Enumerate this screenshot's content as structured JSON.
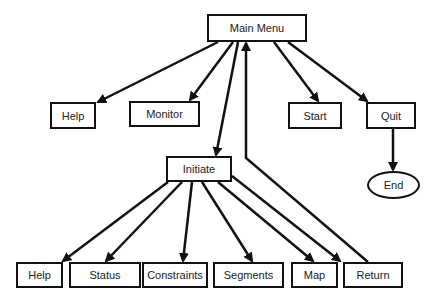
{
  "diagram": {
    "type": "menu-hierarchy",
    "nodes": [
      {
        "id": "main_menu",
        "label": "Main Menu",
        "shape": "rect",
        "x": 207,
        "y": 14,
        "w": 100,
        "h": 28
      },
      {
        "id": "help_top",
        "label": "Help",
        "shape": "rect",
        "x": 50,
        "y": 102,
        "w": 46,
        "h": 27
      },
      {
        "id": "monitor",
        "label": "Monitor",
        "shape": "rect",
        "x": 129,
        "y": 101,
        "w": 71,
        "h": 26
      },
      {
        "id": "start",
        "label": "Start",
        "shape": "rect",
        "x": 288,
        "y": 102,
        "w": 54,
        "h": 27
      },
      {
        "id": "quit",
        "label": "Quit",
        "shape": "rect",
        "x": 366,
        "y": 102,
        "w": 50,
        "h": 27
      },
      {
        "id": "end",
        "label": "End",
        "shape": "ellipse",
        "x": 367,
        "y": 171,
        "w": 53,
        "h": 28
      },
      {
        "id": "initiate",
        "label": "Initiate",
        "shape": "rect",
        "x": 166,
        "y": 156,
        "w": 66,
        "h": 26
      },
      {
        "id": "help_bottom",
        "label": "Help",
        "shape": "rect",
        "x": 16,
        "y": 262,
        "w": 47,
        "h": 26
      },
      {
        "id": "status",
        "label": "Status",
        "shape": "rect",
        "x": 69,
        "y": 262,
        "w": 72,
        "h": 26
      },
      {
        "id": "constraints",
        "label": "Constraints",
        "shape": "rect",
        "x": 142,
        "y": 262,
        "w": 66,
        "h": 26
      },
      {
        "id": "segments",
        "label": "Segments",
        "shape": "rect",
        "x": 213,
        "y": 262,
        "w": 71,
        "h": 26
      },
      {
        "id": "map",
        "label": "Map",
        "shape": "rect",
        "x": 291,
        "y": 262,
        "w": 47,
        "h": 26
      },
      {
        "id": "return",
        "label": "Return",
        "shape": "rect",
        "x": 343,
        "y": 262,
        "w": 60,
        "h": 26
      }
    ],
    "edges": [
      {
        "from": "main_menu",
        "to": "help_top",
        "points": [
          [
            218,
            42
          ],
          [
            98,
            102
          ]
        ]
      },
      {
        "from": "main_menu",
        "to": "monitor",
        "points": [
          [
            233,
            42
          ],
          [
            190,
            100
          ]
        ]
      },
      {
        "from": "main_menu",
        "to": "initiate",
        "points": [
          [
            238,
            42
          ],
          [
            216,
            155
          ]
        ]
      },
      {
        "from": "main_menu",
        "to": "start",
        "points": [
          [
            274,
            42
          ],
          [
            318,
            101
          ]
        ]
      },
      {
        "from": "main_menu",
        "to": "quit",
        "points": [
          [
            288,
            42
          ],
          [
            367,
            101
          ]
        ]
      },
      {
        "from": "quit",
        "to": "end",
        "points": [
          [
            393,
            129
          ],
          [
            393,
            170
          ]
        ]
      },
      {
        "from": "initiate",
        "to": "help_bottom",
        "points": [
          [
            168,
            182
          ],
          [
            63,
            261
          ]
        ]
      },
      {
        "from": "initiate",
        "to": "status",
        "points": [
          [
            182,
            182
          ],
          [
            106,
            261
          ]
        ]
      },
      {
        "from": "initiate",
        "to": "constraints",
        "points": [
          [
            192,
            182
          ],
          [
            183,
            261
          ]
        ]
      },
      {
        "from": "initiate",
        "to": "segments",
        "points": [
          [
            202,
            182
          ],
          [
            252,
            261
          ]
        ]
      },
      {
        "from": "initiate",
        "to": "map",
        "points": [
          [
            218,
            182
          ],
          [
            313,
            261
          ]
        ]
      },
      {
        "from": "initiate",
        "to": "return",
        "points": [
          [
            232,
            176
          ],
          [
            340,
            261
          ]
        ]
      },
      {
        "from": "return",
        "to": "main_menu",
        "points": [
          [
            368,
            262
          ],
          [
            246,
            158
          ],
          [
            246,
            43
          ]
        ]
      }
    ],
    "stroke_color": "#111111"
  }
}
